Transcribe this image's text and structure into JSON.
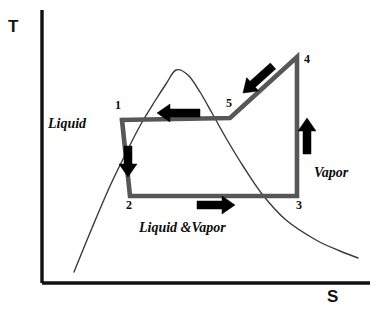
{
  "figure": {
    "kind": "temperature-entropy-diagram",
    "background": "#ffffff"
  },
  "axes": {
    "y_label": "T",
    "x_label": "S",
    "axis_color": "#111111",
    "origin": [
      42,
      283
    ],
    "y_top": 10,
    "x_right": 370
  },
  "region_labels": [
    {
      "text": "Liquid",
      "x": 48,
      "y": 117
    },
    {
      "text": "Liquid &Vapor",
      "x": 139,
      "y": 221
    },
    {
      "text": "Vapor",
      "x": 314,
      "y": 166
    }
  ],
  "state_labels": [
    {
      "text": "1",
      "x": 115,
      "y": 99
    },
    {
      "text": "2",
      "x": 126,
      "y": 199
    },
    {
      "text": "3",
      "x": 296,
      "y": 199
    },
    {
      "text": "4",
      "x": 304,
      "y": 53
    },
    {
      "text": "5",
      "x": 226,
      "y": 97
    }
  ],
  "chart_data": {
    "type": "line",
    "title": "",
    "xlabel": "S",
    "ylabel": "T",
    "grid": false,
    "legend": null,
    "axis_ranges": {
      "x": [
        42,
        370
      ],
      "y": [
        283,
        10
      ]
    },
    "series": [
      {
        "name": "saturation-dome",
        "kind": "vapor-dome",
        "color": "#3b3b3b",
        "width": 1.4,
        "points": [
          [
            74,
            272
          ],
          [
            92,
            228
          ],
          [
            110,
            186
          ],
          [
            127,
            151
          ],
          [
            141,
            124
          ],
          [
            155,
            101
          ],
          [
            166,
            84
          ],
          [
            176,
            70
          ],
          [
            188,
            75
          ],
          [
            200,
            92
          ],
          [
            212,
            113
          ],
          [
            226,
            138
          ],
          [
            243,
            166
          ],
          [
            262,
            194
          ],
          [
            286,
            220
          ],
          [
            316,
            240
          ],
          [
            340,
            251
          ],
          [
            358,
            258
          ]
        ]
      },
      {
        "name": "rankine-cycle-path",
        "kind": "cycle",
        "color": "#575757",
        "width": 4.6,
        "closed": true,
        "points": [
          [
            122,
            120
          ],
          [
            130,
            196
          ],
          [
            297,
            196
          ],
          [
            297,
            57
          ],
          [
            230,
            118
          ],
          [
            122,
            120
          ]
        ]
      }
    ],
    "states": [
      {
        "label": "1",
        "x": 122,
        "y": 120
      },
      {
        "label": "2",
        "x": 130,
        "y": 196
      },
      {
        "label": "3",
        "x": 297,
        "y": 196
      },
      {
        "label": "4",
        "x": 297,
        "y": 57
      },
      {
        "label": "5",
        "x": 230,
        "y": 118
      }
    ],
    "process_arrows": [
      {
        "name": "arrow-5-to-1",
        "direction": "left",
        "from": [
          200,
          113
        ],
        "to": [
          157,
          113
        ],
        "color": "#000000"
      },
      {
        "name": "arrow-1-to-2",
        "direction": "down",
        "from": [
          128,
          146
        ],
        "to": [
          128,
          177
        ],
        "color": "#000000"
      },
      {
        "name": "arrow-2-to-3",
        "direction": "right",
        "from": [
          197,
          205
        ],
        "to": [
          235,
          205
        ],
        "color": "#000000"
      },
      {
        "name": "arrow-3-to-4",
        "direction": "up",
        "from": [
          307,
          154
        ],
        "to": [
          307,
          118
        ],
        "color": "#000000"
      },
      {
        "name": "arrow-4-to-5",
        "direction": "down-left",
        "from": [
          273,
          66
        ],
        "to": [
          243,
          93
        ],
        "color": "#000000"
      }
    ]
  }
}
